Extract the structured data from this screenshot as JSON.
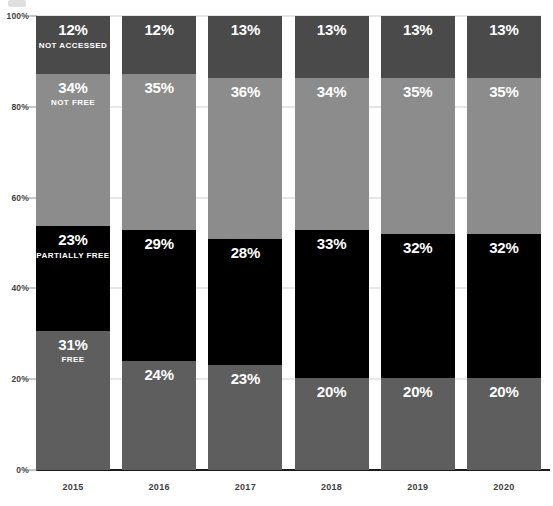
{
  "axis": {
    "y_ticks": [
      "100%",
      "80%",
      "60%",
      "40%",
      "20%",
      "0%"
    ],
    "y_tick_values": [
      100,
      80,
      60,
      40,
      20,
      0
    ]
  },
  "colors": {
    "free": "#5e5e5e",
    "partially_free": "#000000",
    "not_free": "#8c8c8c",
    "not_accessed": "#4a4a4a",
    "gridline": "#d0d0d0",
    "axis_line": "#1b1b1b",
    "tick_label": "#3f3f3f",
    "value_label": "#ffffff",
    "background": "#ffffff"
  },
  "chart_data": {
    "type": "bar",
    "stacked": true,
    "stack_total": 100,
    "title": "",
    "subtitle": "",
    "xlabel": "",
    "ylabel": "",
    "ylim": [
      0,
      100
    ],
    "yticks": [
      0,
      20,
      40,
      60,
      80,
      100
    ],
    "ytick_labels": [
      "0%",
      "20%",
      "40%",
      "60%",
      "80%",
      "100%"
    ],
    "grid": true,
    "legend": "in-bar",
    "legend_column": "2015",
    "categories": [
      "2015",
      "2016",
      "2017",
      "2018",
      "2019",
      "2020"
    ],
    "series": [
      {
        "name": "FREE",
        "values": [
          31,
          24,
          23,
          20,
          20,
          20
        ]
      },
      {
        "name": "PARTIALLY FREE",
        "values": [
          23,
          29,
          28,
          33,
          32,
          32
        ]
      },
      {
        "name": "NOT FREE",
        "values": [
          34,
          35,
          36,
          34,
          35,
          35
        ]
      },
      {
        "name": "NOT ACCESSED",
        "values": [
          12,
          12,
          13,
          13,
          13,
          13
        ]
      }
    ]
  },
  "columns": [
    {
      "year": "2015",
      "segments": [
        {
          "key": "not_accessed",
          "value": 12,
          "label": "12%",
          "category": "NOT ACCESSED",
          "show_category": true
        },
        {
          "key": "not_free",
          "value": 34,
          "label": "34%",
          "category": "NOT FREE",
          "show_category": true
        },
        {
          "key": "partially_free",
          "value": 23,
          "label": "23%",
          "category": "PARTIALLY FREE",
          "show_category": true
        },
        {
          "key": "free",
          "value": 31,
          "label": "31%",
          "category": "FREE",
          "show_category": true
        }
      ]
    },
    {
      "year": "2016",
      "segments": [
        {
          "key": "not_accessed",
          "value": 12,
          "label": "12%",
          "category": "NOT ACCESSED",
          "show_category": false
        },
        {
          "key": "not_free",
          "value": 35,
          "label": "35%",
          "category": "NOT FREE",
          "show_category": false
        },
        {
          "key": "partially_free",
          "value": 29,
          "label": "29%",
          "category": "PARTIALLY FREE",
          "show_category": false
        },
        {
          "key": "free",
          "value": 24,
          "label": "24%",
          "category": "FREE",
          "show_category": false
        }
      ]
    },
    {
      "year": "2017",
      "segments": [
        {
          "key": "not_accessed",
          "value": 13,
          "label": "13%",
          "category": "NOT ACCESSED",
          "show_category": false
        },
        {
          "key": "not_free",
          "value": 36,
          "label": "36%",
          "category": "NOT FREE",
          "show_category": false
        },
        {
          "key": "partially_free",
          "value": 28,
          "label": "28%",
          "category": "PARTIALLY FREE",
          "show_category": false
        },
        {
          "key": "free",
          "value": 23,
          "label": "23%",
          "category": "FREE",
          "show_category": false
        }
      ]
    },
    {
      "year": "2018",
      "segments": [
        {
          "key": "not_accessed",
          "value": 13,
          "label": "13%",
          "category": "NOT ACCESSED",
          "show_category": false
        },
        {
          "key": "not_free",
          "value": 34,
          "label": "34%",
          "category": "NOT FREE",
          "show_category": false
        },
        {
          "key": "partially_free",
          "value": 33,
          "label": "33%",
          "category": "PARTIALLY FREE",
          "show_category": false
        },
        {
          "key": "free",
          "value": 20,
          "label": "20%",
          "category": "FREE",
          "show_category": false
        }
      ]
    },
    {
      "year": "2019",
      "segments": [
        {
          "key": "not_accessed",
          "value": 13,
          "label": "13%",
          "category": "NOT ACCESSED",
          "show_category": false
        },
        {
          "key": "not_free",
          "value": 35,
          "label": "35%",
          "category": "NOT FREE",
          "show_category": false
        },
        {
          "key": "partially_free",
          "value": 32,
          "label": "32%",
          "category": "PARTIALLY FREE",
          "show_category": false
        },
        {
          "key": "free",
          "value": 20,
          "label": "20%",
          "category": "FREE",
          "show_category": false
        }
      ]
    },
    {
      "year": "2020",
      "segments": [
        {
          "key": "not_accessed",
          "value": 13,
          "label": "13%",
          "category": "NOT ACCESSED",
          "show_category": false
        },
        {
          "key": "not_free",
          "value": 35,
          "label": "35%",
          "category": "NOT FREE",
          "show_category": false
        },
        {
          "key": "partially_free",
          "value": 32,
          "label": "32%",
          "category": "PARTIALLY FREE",
          "show_category": false
        },
        {
          "key": "free",
          "value": 20,
          "label": "20%",
          "category": "FREE",
          "show_category": false
        }
      ]
    }
  ]
}
